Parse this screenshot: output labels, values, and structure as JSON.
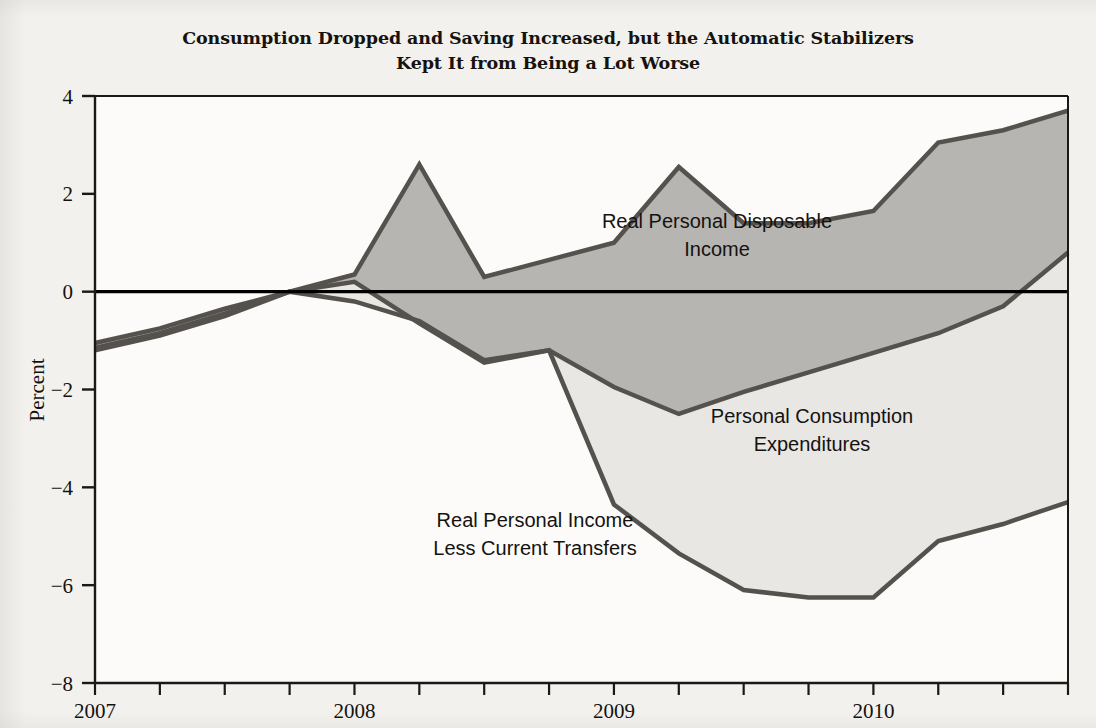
{
  "figure": {
    "title_line1": "Consumption Dropped and Saving Increased, but the Automatic Stabilizers",
    "title_line2": "Kept It from Being a Lot Worse",
    "background_color": "#f2f1ee",
    "plot_background_color": "#fcfbf9"
  },
  "axes": {
    "ylabel": "Percent",
    "y_ticks": [
      "4",
      "2",
      "0",
      "-2",
      "-4",
      "-6",
      "-8"
    ],
    "x_ticks": [
      "2007",
      "2008",
      "2009",
      "2010"
    ],
    "zero_line_color": "#000000"
  },
  "annotations": {
    "disposable_line1": "Real Personal Disposable",
    "disposable_line2": "Income",
    "pce_line1": "Personal Consumption",
    "pce_line2": "Expenditures",
    "less_transfers_line1": "Real Personal Income",
    "less_transfers_line2": "Less Current Transfers"
  },
  "chart_data": {
    "type": "line",
    "title": "Consumption Dropped and Saving Increased, but the Automatic Stabilizers Kept It from Being a Lot Worse",
    "xlabel": "",
    "ylabel": "Percent",
    "ylim": [
      -8,
      4
    ],
    "xlim": [
      "2007Q1",
      "2010Q4"
    ],
    "grid": false,
    "legend": "inline-annotations",
    "fill_between": true,
    "fill_color_upper": "#b6b5b2",
    "fill_color_lower": "#e8e7e4",
    "line_color": "#55524e",
    "line_width": 4,
    "x": [
      "2007Q1",
      "2007Q2",
      "2007Q3",
      "2007Q4",
      "2008Q1",
      "2008Q2",
      "2008Q3",
      "2008Q4",
      "2009Q1",
      "2009Q2",
      "2009Q3",
      "2009Q4",
      "2010Q1",
      "2010Q2",
      "2010Q3",
      "2010Q4"
    ],
    "x_numeric": [
      2007.0,
      2007.25,
      2007.5,
      2007.75,
      2008.0,
      2008.25,
      2008.5,
      2008.75,
      2009.0,
      2009.25,
      2009.5,
      2009.75,
      2010.0,
      2010.25,
      2010.5,
      2010.75
    ],
    "series": [
      {
        "name": "Real Personal Disposable Income",
        "values": [
          -1.05,
          -0.75,
          -0.35,
          0.0,
          0.35,
          2.6,
          0.3,
          0.65,
          1.0,
          2.55,
          1.4,
          1.4,
          1.65,
          3.05,
          3.3,
          3.7
        ]
      },
      {
        "name": "Personal Consumption Expenditures",
        "values": [
          -1.15,
          -0.85,
          -0.45,
          0.0,
          -0.2,
          -0.6,
          -1.4,
          -1.2,
          -1.95,
          -2.5,
          -2.05,
          -1.65,
          -1.25,
          -0.85,
          -0.3,
          0.8
        ]
      },
      {
        "name": "Real Personal Income Less Current Transfers",
        "values": [
          -1.2,
          -0.9,
          -0.5,
          0.0,
          0.2,
          -0.65,
          -1.45,
          -1.2,
          -4.35,
          -5.35,
          -6.1,
          -6.25,
          -6.25,
          -5.1,
          -4.75,
          -4.3
        ]
      }
    ]
  }
}
